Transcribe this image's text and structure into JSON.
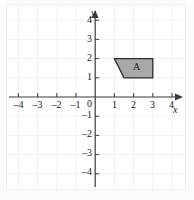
{
  "figure": {
    "type": "coordinate-plane-diagram",
    "background_color": "#ffffff",
    "outer_background_color": "#fbfbfb",
    "grid": {
      "visible": true,
      "color": "#f3eff0",
      "spacing_units": 1
    },
    "axes": {
      "color": "#3a3a3a",
      "x_label": "x",
      "y_label": "y",
      "origin_label": "0",
      "x_range": [
        -4.6,
        4.6
      ],
      "y_range": [
        -4.6,
        4.6
      ],
      "x_ticks": [
        -4,
        -3,
        -2,
        -1,
        1,
        2,
        3,
        4
      ],
      "y_ticks": [
        4,
        3,
        2,
        1,
        -1,
        -2,
        -3,
        -4
      ],
      "x_tick_labels": [
        "–4",
        "–3",
        "–2",
        "–1",
        "1",
        "2",
        "3",
        "4"
      ],
      "y_tick_labels": [
        "4",
        "3",
        "2",
        "1",
        "–1",
        "–2",
        "–3",
        "–4"
      ],
      "arrows": [
        "x-positive",
        "y-positive"
      ]
    },
    "shapes": [
      {
        "name": "A",
        "label": "A",
        "label_position": [
          2.2,
          1.55
        ],
        "type": "trapezoid",
        "fill_color": "#a8a8a8",
        "stroke_color": "#2b2b2b",
        "vertices": [
          [
            1,
            2
          ],
          [
            3,
            2
          ],
          [
            3,
            1
          ],
          [
            1.5,
            1
          ]
        ]
      }
    ]
  }
}
